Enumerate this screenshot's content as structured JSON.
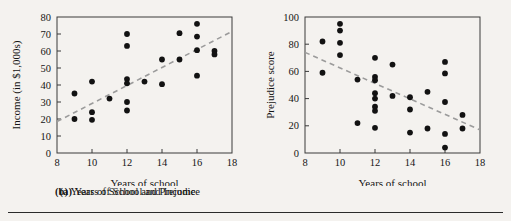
{
  "figure": {
    "background_color": "#f4f2ef",
    "point_color": "#121212",
    "trend_color": "#9b9b9b",
    "axis_color": "#3a3a3a"
  },
  "panel_a": {
    "caption_lead": "(a)",
    "caption_text": "Years of School and Income"
  },
  "panel_b": {
    "caption_lead": "(b)",
    "caption_text": "Years of School and Prejudice"
  },
  "chart_data": [
    {
      "type": "scatter",
      "title": "(a) Years of School and Income",
      "xlabel": "Years of school",
      "ylabel": "Income (in $1,000s)",
      "xlim": [
        8,
        18
      ],
      "ylim": [
        0,
        80
      ],
      "xticks": [
        8,
        10,
        12,
        14,
        16,
        18
      ],
      "yticks": [
        0,
        10,
        20,
        30,
        40,
        50,
        60,
        70,
        80
      ],
      "xtick_labels": [
        "8",
        "10",
        "12",
        "14",
        "16",
        "18"
      ],
      "ytick_labels": [
        "0",
        "10",
        "20",
        "30",
        "40",
        "50",
        "60",
        "70",
        "80"
      ],
      "grid": false,
      "legend": null,
      "points": [
        {
          "x": 9,
          "y": 35
        },
        {
          "x": 9,
          "y": 20
        },
        {
          "x": 10,
          "y": 42
        },
        {
          "x": 10,
          "y": 24
        },
        {
          "x": 10,
          "y": 19.5
        },
        {
          "x": 11,
          "y": 32
        },
        {
          "x": 12,
          "y": 70
        },
        {
          "x": 12,
          "y": 63
        },
        {
          "x": 12,
          "y": 43.5
        },
        {
          "x": 12,
          "y": 41
        },
        {
          "x": 12,
          "y": 30
        },
        {
          "x": 12,
          "y": 25
        },
        {
          "x": 13,
          "y": 42
        },
        {
          "x": 14,
          "y": 55
        },
        {
          "x": 14,
          "y": 40.5
        },
        {
          "x": 15,
          "y": 70.5
        },
        {
          "x": 15,
          "y": 55
        },
        {
          "x": 16,
          "y": 76
        },
        {
          "x": 16,
          "y": 68.5
        },
        {
          "x": 16,
          "y": 60.5
        },
        {
          "x": 16,
          "y": 45.5
        },
        {
          "x": 17,
          "y": 60
        },
        {
          "x": 17,
          "y": 58
        }
      ],
      "trendline": {
        "x1": 8,
        "y1": 18.5,
        "x2": 18,
        "y2": 71.5,
        "style": "dashed"
      }
    },
    {
      "type": "scatter",
      "title": "(b) Years of School and Prejudice",
      "xlabel": "Years of school",
      "ylabel": "Prejudice score",
      "xlim": [
        8,
        18
      ],
      "ylim": [
        0,
        100
      ],
      "xticks": [
        8,
        10,
        12,
        14,
        16,
        18
      ],
      "yticks": [
        0,
        20,
        40,
        60,
        80,
        100
      ],
      "xtick_labels": [
        "8",
        "10",
        "12",
        "14",
        "16",
        "18"
      ],
      "ytick_labels": [
        "0",
        "20",
        "40",
        "60",
        "80",
        "100"
      ],
      "grid": false,
      "legend": null,
      "points": [
        {
          "x": 9,
          "y": 82
        },
        {
          "x": 9,
          "y": 59
        },
        {
          "x": 10,
          "y": 95
        },
        {
          "x": 10,
          "y": 90
        },
        {
          "x": 10,
          "y": 81
        },
        {
          "x": 10,
          "y": 72
        },
        {
          "x": 11,
          "y": 54
        },
        {
          "x": 11,
          "y": 22
        },
        {
          "x": 12,
          "y": 70
        },
        {
          "x": 12,
          "y": 56
        },
        {
          "x": 12,
          "y": 53.5
        },
        {
          "x": 12,
          "y": 44
        },
        {
          "x": 12,
          "y": 40
        },
        {
          "x": 12,
          "y": 34
        },
        {
          "x": 12,
          "y": 31
        },
        {
          "x": 12,
          "y": 18.5
        },
        {
          "x": 13,
          "y": 65
        },
        {
          "x": 13,
          "y": 42
        },
        {
          "x": 14,
          "y": 41
        },
        {
          "x": 14,
          "y": 32
        },
        {
          "x": 14,
          "y": 15
        },
        {
          "x": 15,
          "y": 45
        },
        {
          "x": 15,
          "y": 18
        },
        {
          "x": 16,
          "y": 67
        },
        {
          "x": 16,
          "y": 58.5
        },
        {
          "x": 16,
          "y": 37.5
        },
        {
          "x": 16,
          "y": 14
        },
        {
          "x": 16,
          "y": 4
        },
        {
          "x": 17,
          "y": 28
        },
        {
          "x": 17,
          "y": 18
        }
      ],
      "trendline": {
        "x1": 8,
        "y1": 74,
        "x2": 18,
        "y2": 17,
        "style": "dashed"
      }
    }
  ]
}
